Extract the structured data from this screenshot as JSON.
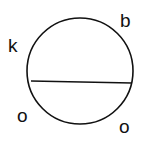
{
  "diagram": {
    "circle": {
      "cx": 80,
      "cy": 71,
      "r": 53,
      "stroke": "#111111"
    },
    "chord": {
      "x1": 31,
      "y1": 81,
      "x2": 132,
      "y2": 83
    },
    "labels": [
      {
        "id": "k",
        "text": "k",
        "x": 8,
        "y": 52
      },
      {
        "id": "b",
        "text": "b",
        "x": 120,
        "y": 27
      },
      {
        "id": "o-left",
        "text": "o",
        "x": 17,
        "y": 122
      },
      {
        "id": "o-right",
        "text": "o",
        "x": 119,
        "y": 133
      }
    ]
  }
}
